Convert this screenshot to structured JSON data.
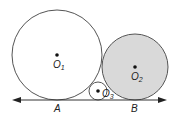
{
  "diagram": {
    "line": {
      "label_a": "A",
      "label_b": "B"
    },
    "circles": [
      {
        "id": "O1",
        "label": "O",
        "subscript": "1",
        "fill": "#ffffff"
      },
      {
        "id": "O2",
        "label": "O",
        "subscript": "2",
        "fill": "#d9d9d9"
      },
      {
        "id": "O3",
        "label": "O",
        "subscript": "3",
        "fill": "#ffffff"
      }
    ]
  }
}
